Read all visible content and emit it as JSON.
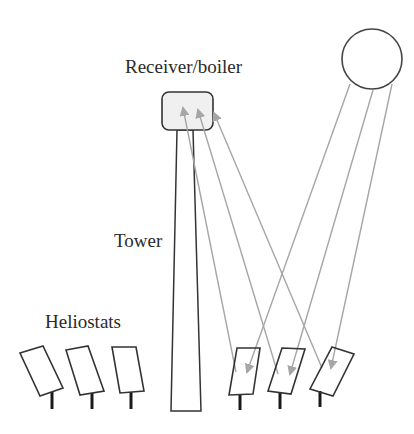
{
  "labels": {
    "receiver": "Receiver/boiler",
    "tower": "Tower",
    "heliostats": "Heliostats"
  },
  "colors": {
    "outline": "#333333",
    "ray": "#a6a6a6",
    "receiver_fill": "#f0f0f0",
    "post": "#1a1a1a"
  },
  "components": {
    "sun": {
      "shape": "circle"
    },
    "receiver": {
      "shape": "rounded-rectangle"
    },
    "tower": {
      "shape": "tapered-column"
    },
    "heliostats": {
      "count": 6,
      "active_count": 3
    },
    "rays": {
      "incoming_from_sun": 3,
      "reflected_to_receiver": 3
    }
  }
}
